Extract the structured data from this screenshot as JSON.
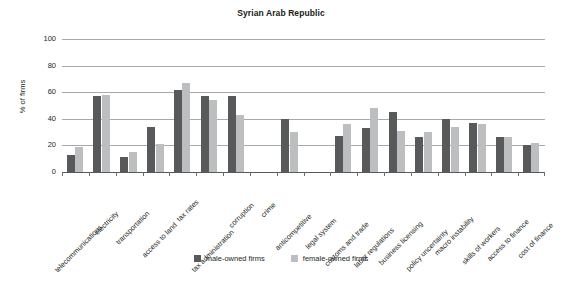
{
  "chart_data": {
    "type": "bar",
    "title": "Syrian Arab Republic",
    "xlabel": "",
    "ylabel": "% of firms",
    "ylim": [
      0,
      100
    ],
    "yticks": [
      0,
      20,
      40,
      60,
      80,
      100
    ],
    "grid": true,
    "legend_position": "bottom-center",
    "categories": [
      "telecommunications",
      "electricity",
      "transportation",
      "access to land",
      "tax rates",
      "tax administration",
      "corruption",
      "crime",
      "anticompetitive",
      "legal system",
      "customs and trade",
      "labor regulations",
      "business licensing",
      "policy uncertainty",
      "macro instability",
      "skills of workers",
      "access to finance",
      "cost of finance"
    ],
    "series": [
      {
        "name": "male-owned firms",
        "color": "#58595b",
        "values": [
          13,
          57,
          11,
          34,
          62,
          57,
          57,
          null,
          40,
          null,
          27,
          33,
          45,
          26,
          40,
          37,
          26,
          20
        ]
      },
      {
        "name": "female-owned firms",
        "color": "#bcbec0",
        "values": [
          19,
          58,
          15,
          21,
          67,
          54,
          43,
          null,
          30,
          null,
          36,
          48,
          31,
          30,
          34,
          36,
          26,
          22
        ]
      }
    ]
  },
  "legend": {
    "items": [
      {
        "label": "male-owned firms",
        "color": "#58595b"
      },
      {
        "label": "female-owned firms",
        "color": "#bcbec0"
      }
    ]
  }
}
